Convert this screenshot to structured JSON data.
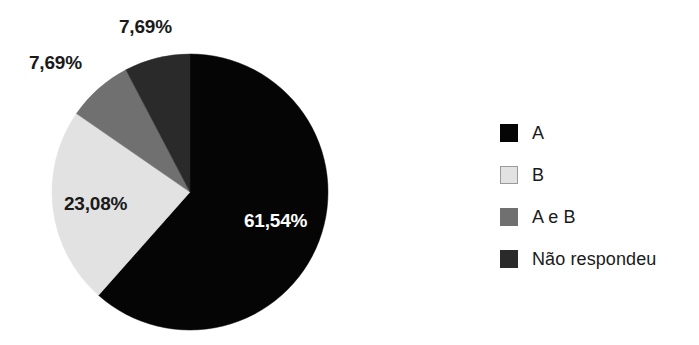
{
  "chart_data": {
    "type": "pie",
    "title": "",
    "subtitle": "",
    "legend_position": "right",
    "grid": false,
    "categories": [
      "A",
      "B",
      "A e B",
      "Não respondeu"
    ],
    "values": [
      61.54,
      23.08,
      7.69,
      7.69
    ],
    "value_labels": [
      "61,54%",
      "23,08%",
      "7,69%",
      "7,69%"
    ],
    "colors": [
      "#050505",
      "#e2e2e2",
      "#707070",
      "#2a2a2a"
    ],
    "start_angle_deg": 0,
    "direction": "clockwise",
    "slices": [
      {
        "name": "A",
        "value": 61.54,
        "label": "61,54%",
        "color": "#050505",
        "label_color": "#ffffff",
        "label_placement": "inside"
      },
      {
        "name": "B",
        "value": 23.08,
        "label": "23,08%",
        "color": "#e2e2e2",
        "label_color": "#1a1a1a",
        "label_placement": "inside"
      },
      {
        "name": "A e B",
        "value": 7.69,
        "label": "7,69%",
        "color": "#707070",
        "label_color": "#1a1a1a",
        "label_placement": "outside"
      },
      {
        "name": "Não respondeu",
        "value": 7.69,
        "label": "7,69%",
        "color": "#2a2a2a",
        "label_color": "#1a1a1a",
        "label_placement": "outside"
      }
    ]
  },
  "legend": {
    "items": [
      {
        "label": "A",
        "color": "#050505",
        "swatch": "swatch-solid"
      },
      {
        "label": "B",
        "color": "#e2e2e2",
        "swatch": "swatch-light"
      },
      {
        "label": "A e B",
        "color": "#707070",
        "swatch": "swatch-solid"
      },
      {
        "label": "Não respondeu",
        "color": "#2a2a2a",
        "swatch": "swatch-solid"
      }
    ]
  },
  "figure": {
    "background": "#ffffff",
    "pie_center_x": 190,
    "pie_center_y": 192,
    "pie_radius": 138
  }
}
